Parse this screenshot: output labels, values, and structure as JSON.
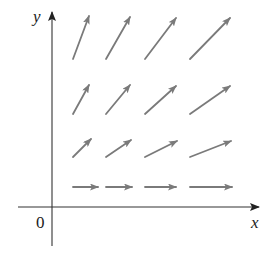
{
  "diagram": {
    "title": "",
    "type": "vector-field",
    "axes": {
      "x_label": "x",
      "y_label": "y",
      "origin_label": "0",
      "axis_color": "#333333"
    },
    "arrow_color": "#7a7a7a",
    "grid_columns": 4,
    "grid_rows": 4,
    "arrows": [
      {
        "row": 1,
        "col": 1,
        "x1": 73,
        "y1": 187,
        "x2": 98,
        "y2": 187
      },
      {
        "row": 1,
        "col": 2,
        "x1": 106,
        "y1": 187,
        "x2": 132,
        "y2": 187
      },
      {
        "row": 1,
        "col": 3,
        "x1": 145,
        "y1": 187,
        "x2": 176,
        "y2": 187
      },
      {
        "row": 1,
        "col": 4,
        "x1": 190,
        "y1": 187,
        "x2": 232,
        "y2": 187
      },
      {
        "row": 2,
        "col": 1,
        "x1": 73,
        "y1": 157,
        "x2": 91,
        "y2": 139
      },
      {
        "row": 2,
        "col": 2,
        "x1": 106,
        "y1": 157,
        "x2": 131,
        "y2": 140
      },
      {
        "row": 2,
        "col": 3,
        "x1": 145,
        "y1": 157,
        "x2": 177,
        "y2": 141
      },
      {
        "row": 2,
        "col": 4,
        "x1": 190,
        "y1": 157,
        "x2": 231,
        "y2": 141
      },
      {
        "row": 3,
        "col": 1,
        "x1": 73,
        "y1": 114,
        "x2": 89,
        "y2": 85
      },
      {
        "row": 3,
        "col": 2,
        "x1": 106,
        "y1": 114,
        "x2": 130,
        "y2": 85
      },
      {
        "row": 3,
        "col": 3,
        "x1": 145,
        "y1": 114,
        "x2": 176,
        "y2": 86
      },
      {
        "row": 3,
        "col": 4,
        "x1": 190,
        "y1": 114,
        "x2": 230,
        "y2": 86
      },
      {
        "row": 4,
        "col": 1,
        "x1": 73,
        "y1": 59,
        "x2": 89,
        "y2": 16
      },
      {
        "row": 4,
        "col": 2,
        "x1": 106,
        "y1": 59,
        "x2": 130,
        "y2": 17
      },
      {
        "row": 4,
        "col": 3,
        "x1": 145,
        "y1": 59,
        "x2": 176,
        "y2": 18
      },
      {
        "row": 4,
        "col": 4,
        "x1": 190,
        "y1": 59,
        "x2": 230,
        "y2": 18
      }
    ]
  }
}
